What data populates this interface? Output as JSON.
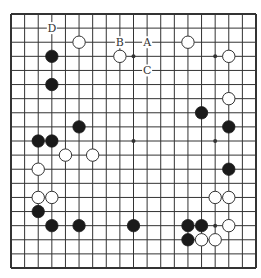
{
  "diagram": {
    "type": "go-board",
    "size": 19,
    "colors": {
      "background": "#ffffff",
      "line": "#333333",
      "black_stone": "#1a1a1a",
      "white_stone": "#ffffff",
      "stone_outline": "#333333"
    },
    "star_points": [
      [
        3,
        3
      ],
      [
        9,
        3
      ],
      [
        15,
        3
      ],
      [
        3,
        9
      ],
      [
        9,
        9
      ],
      [
        15,
        9
      ],
      [
        3,
        15
      ],
      [
        9,
        15
      ],
      [
        15,
        15
      ]
    ],
    "black_stones": [
      [
        3,
        3
      ],
      [
        3,
        5
      ],
      [
        5,
        8
      ],
      [
        2,
        9
      ],
      [
        3,
        9
      ],
      [
        2,
        14
      ],
      [
        3,
        15
      ],
      [
        5,
        15
      ],
      [
        9,
        15
      ],
      [
        14,
        7
      ],
      [
        16,
        8
      ],
      [
        16,
        11
      ],
      [
        13,
        15
      ],
      [
        14,
        15
      ],
      [
        13,
        16
      ]
    ],
    "white_stones": [
      [
        5,
        2
      ],
      [
        13,
        2
      ],
      [
        8,
        3
      ],
      [
        16,
        3
      ],
      [
        16,
        6
      ],
      [
        4,
        10
      ],
      [
        6,
        10
      ],
      [
        2,
        11
      ],
      [
        2,
        13
      ],
      [
        3,
        13
      ],
      [
        15,
        13
      ],
      [
        16,
        13
      ],
      [
        16,
        15
      ],
      [
        14,
        16
      ],
      [
        15,
        16
      ]
    ],
    "labels": [
      {
        "text": "D",
        "col": 3,
        "row": 1
      },
      {
        "text": "B",
        "col": 8,
        "row": 2
      },
      {
        "text": "A",
        "col": 10,
        "row": 2
      },
      {
        "text": "C",
        "col": 10,
        "row": 4
      }
    ]
  }
}
